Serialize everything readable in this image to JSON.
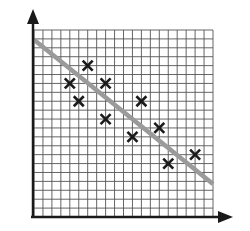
{
  "chart_data": {
    "type": "scatter",
    "title": "",
    "xlabel": "",
    "ylabel": "",
    "grid": true,
    "legend": null,
    "xlim": [
      0,
      20
    ],
    "ylim": [
      0,
      21
    ],
    "marker": "x",
    "points": [
      {
        "x": 4,
        "y": 15
      },
      {
        "x": 5,
        "y": 13
      },
      {
        "x": 6,
        "y": 17
      },
      {
        "x": 8,
        "y": 15
      },
      {
        "x": 8,
        "y": 11
      },
      {
        "x": 11,
        "y": 9
      },
      {
        "x": 12,
        "y": 13
      },
      {
        "x": 14,
        "y": 10
      },
      {
        "x": 15,
        "y": 6
      },
      {
        "x": 18,
        "y": 7
      }
    ],
    "trend_line": {
      "x0": 0,
      "y0": 19.9,
      "x1": 20,
      "y1": 3.7,
      "label": "line of best fit"
    },
    "colors": {
      "grid": "#555555",
      "axis": "#1a1a1a",
      "marker": "#1a1a1a",
      "trend_line": "#9a9a9a",
      "background": "#ffffff"
    }
  }
}
